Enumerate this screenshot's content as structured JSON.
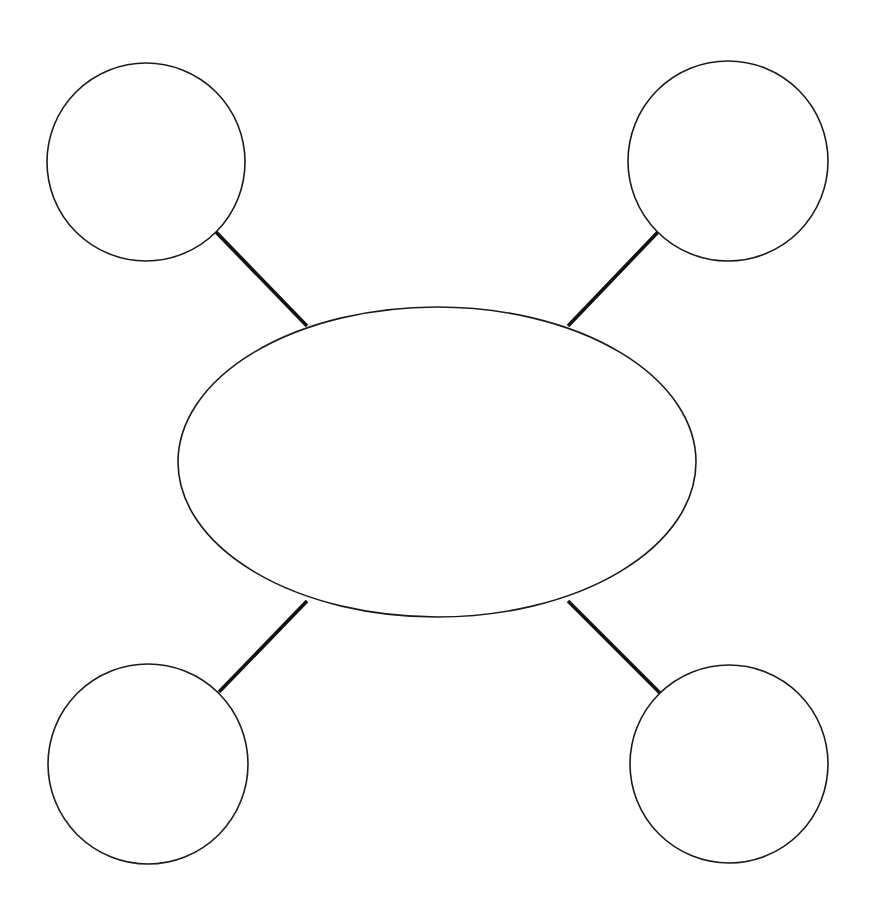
{
  "canvas": {
    "width": 882,
    "height": 911,
    "background": "#ffffff"
  },
  "diagram": {
    "type": "spider-map",
    "title": "",
    "stroke_color": "#1a1a1a",
    "connector_color": "#111111",
    "shape_fill": "#ffffff",
    "shape_stroke_width": 1.6,
    "connector_stroke_width": 3.6,
    "center": {
      "id": "center-ellipse",
      "label": "",
      "cx": 437,
      "cy": 462,
      "rx": 259,
      "ry": 155
    },
    "nodes": [
      {
        "id": "node-top-left",
        "label": "",
        "cx": 146,
        "cy": 162,
        "r": 99
      },
      {
        "id": "node-top-right",
        "label": "",
        "cx": 728,
        "cy": 161,
        "r": 100
      },
      {
        "id": "node-bottom-left",
        "label": "",
        "cx": 148,
        "cy": 764,
        "r": 100
      },
      {
        "id": "node-bottom-right",
        "label": "",
        "cx": 729,
        "cy": 764,
        "r": 99
      }
    ],
    "connectors": [
      {
        "id": "connector-top-left",
        "from": "node-top-left",
        "to": "center-ellipse",
        "x1": 216,
        "y1": 232,
        "x2": 307,
        "y2": 326
      },
      {
        "id": "connector-top-right",
        "from": "node-top-right",
        "to": "center-ellipse",
        "x1": 658,
        "y1": 232,
        "x2": 568,
        "y2": 326
      },
      {
        "id": "connector-bottom-left",
        "from": "center-ellipse",
        "to": "node-bottom-left",
        "x1": 307,
        "y1": 601,
        "x2": 219,
        "y2": 692
      },
      {
        "id": "connector-bottom-right",
        "from": "center-ellipse",
        "to": "node-bottom-right",
        "x1": 568,
        "y1": 601,
        "x2": 660,
        "y2": 693
      }
    ]
  }
}
